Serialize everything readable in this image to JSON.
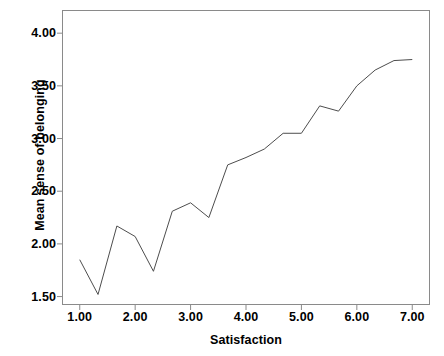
{
  "chart_data": {
    "type": "line",
    "title": "",
    "xlabel": "Satisfaction",
    "ylabel": "Mean sense of belonging",
    "xlim": [
      0.68,
      7.32
    ],
    "ylim": [
      1.42,
      4.22
    ],
    "xticks": [
      1.0,
      2.0,
      3.0,
      4.0,
      5.0,
      6.0,
      7.0
    ],
    "xtick_labels": [
      "1.00",
      "2.00",
      "3.00",
      "4.00",
      "5.00",
      "6.00",
      "7.00"
    ],
    "yticks": [
      1.5,
      2.0,
      2.5,
      3.0,
      3.5,
      4.0
    ],
    "ytick_labels": [
      "1.50",
      "2.00",
      "2.50",
      "3.00",
      "3.50",
      "4.00"
    ],
    "grid": false,
    "legend": null,
    "series": [
      {
        "name": "Mean sense of belonging",
        "color": "#4d4d4d",
        "line_width": 1,
        "markers": false,
        "x": [
          1.0,
          1.33,
          1.67,
          2.0,
          2.33,
          2.67,
          3.0,
          3.33,
          3.67,
          4.0,
          4.33,
          4.67,
          5.0,
          5.33,
          5.67,
          6.0,
          6.33,
          6.67,
          7.0
        ],
        "values": [
          1.85,
          1.52,
          2.17,
          2.07,
          1.74,
          2.31,
          2.39,
          2.25,
          2.75,
          2.82,
          2.9,
          3.05,
          3.05,
          3.31,
          3.26,
          3.5,
          3.65,
          3.74,
          3.75
        ]
      }
    ]
  },
  "style": {
    "frame_color": "#8a8a8a",
    "text_color": "#000000",
    "background": "#ffffff"
  }
}
